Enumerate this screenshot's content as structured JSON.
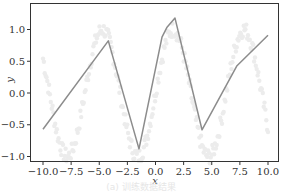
{
  "chart_data": {
    "type": "line",
    "title": "",
    "xlabel": "x",
    "ylabel": "y",
    "xlim": [
      -10.5,
      10.5
    ],
    "ylim": [
      -1.08,
      1.45
    ],
    "grid": false,
    "legend": null,
    "x_ticks": [
      -10.0,
      -7.5,
      -5.0,
      -2.5,
      0.0,
      2.5,
      5.0,
      7.5,
      10.0
    ],
    "x_tick_labels": [
      "−10.0",
      "−7.5",
      "−5.0",
      "−2.5",
      "0.0",
      "2.5",
      "5.0",
      "7.5",
      "10.0"
    ],
    "y_ticks": [
      1.0,
      0.5,
      0.0,
      -0.5,
      -1.0
    ],
    "y_tick_labels": [
      "1.0",
      "0.5",
      "0.0",
      "−0.5",
      "−1.0"
    ],
    "series": [
      {
        "name": "fitted line",
        "color": "#8c8c8c",
        "x": [
          -10.0,
          -4.2,
          -1.47,
          0.58,
          1.0,
          1.73,
          4.13,
          7.24,
          10.0
        ],
        "y": [
          -0.57,
          0.82,
          -0.88,
          0.88,
          1.03,
          1.18,
          -0.58,
          0.43,
          0.91
        ]
      },
      {
        "name": "noisy samples (faint)",
        "type": "scatter",
        "color": "#ececec",
        "function": "sin(x)",
        "x_range": [
          -10.0,
          10.0
        ]
      }
    ],
    "caption": "(a) 训练数据结果"
  }
}
